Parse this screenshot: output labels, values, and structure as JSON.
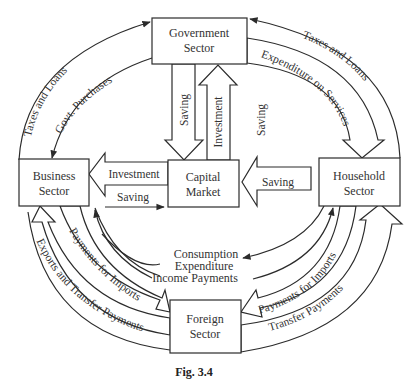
{
  "figure": {
    "caption": "Fig. 3.4",
    "sectors": {
      "government": {
        "line1": "Government",
        "line2": "Sector"
      },
      "business": {
        "line1": "Business",
        "line2": "Sector"
      },
      "capital_market": {
        "line1": "Capital",
        "line2": "Market"
      },
      "household": {
        "line1": "Household",
        "line2": "Sector"
      },
      "foreign": {
        "line1": "Foreign",
        "line2": "Sector"
      }
    },
    "flows": {
      "business_to_gov_taxes": "Taxes and Loans",
      "gov_to_business_purchases": "Govt. Purchases",
      "household_to_gov_taxes": "Taxes and Loans",
      "gov_to_household_services": "Expenditure on Services",
      "gov_to_capital_saving": "Saving",
      "capital_to_gov_investment": "Investment",
      "household_to_capital_saving": "Saving",
      "capital_to_business_investment": "Investment",
      "business_to_capital_saving": "Saving",
      "business_household_center_1": "Consumption",
      "business_household_center_2": "Expenditure",
      "business_household_center_3": "Income Payments",
      "business_to_foreign_imports": "Payments for Imports",
      "foreign_to_business_exports": "Exports and Transfer Payments",
      "household_to_foreign_imports": "Payments for Imports",
      "foreign_to_household_transfers": "Transfer Payments"
    }
  }
}
